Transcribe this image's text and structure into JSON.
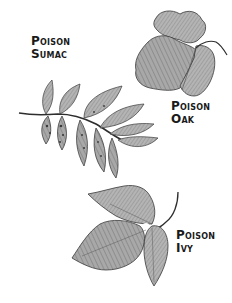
{
  "plants": [
    {
      "id": "sumac",
      "line1": "Poison",
      "line2": "Sumac",
      "description": "pinnately compound leaf with many pointed leaflets along a stem"
    },
    {
      "id": "oak",
      "line1": "Poison",
      "line2": "Oak",
      "description": "three lobed, wavy-edged leaflets with a curved stem"
    },
    {
      "id": "ivy",
      "line1": "Poison",
      "line2": "Ivy",
      "description": "three pointed leaflets with a long curved stem"
    }
  ],
  "colors": {
    "background": "#ffffff",
    "ink": "#1a1a1a",
    "leaf_fill": "#a9a9a9",
    "leaf_shade": "#7a7a7a",
    "leaf_outline": "#3a3a3a"
  }
}
